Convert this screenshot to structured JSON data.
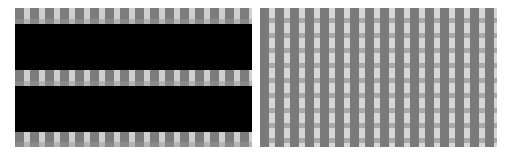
{
  "image": {
    "description": "Two side-by-side grayscale stripe/grid pattern panels",
    "colors": {
      "background": "#ffffff",
      "dark_stripe": "#7c7c7c",
      "light_stripe": "#cfcfcf",
      "black_band": "#000000"
    },
    "left_panel": {
      "pattern": "vertical stripe bands alternating with solid black bands",
      "stripe_bands": 3,
      "black_bands": 2
    },
    "right_panel": {
      "pattern": "grid of vertical dark stripes over horizontal light/gray bands"
    }
  }
}
